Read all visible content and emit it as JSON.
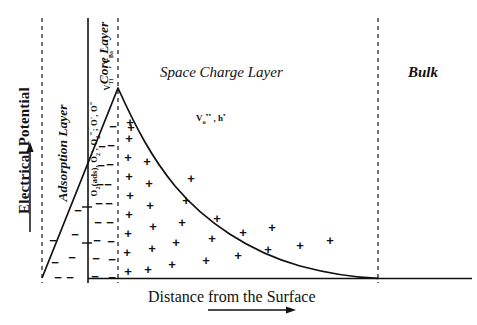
{
  "figure": {
    "type": "schematic-potential-profile",
    "y_axis_label": "Electrical Potential",
    "x_axis_label": "Distance from the Surface",
    "x_axis_arrow": "right-arrow",
    "y_axis_arrow": "up-arrow"
  },
  "regions": [
    {
      "id": "adsorption",
      "label": "Adsorption Layer",
      "species_plain": "O2(ads), O2-, O2=; O-, O=",
      "x_start": 42,
      "x_end": 88
    },
    {
      "id": "core",
      "label": "Core Layer",
      "species_plain": "V_Ti''' , V_Ba''",
      "x_start": 88,
      "x_end": 118
    },
    {
      "id": "space-charge",
      "label": "Space Charge Layer",
      "species_plain": "Vo.. , h.",
      "x_start": 118,
      "x_end": 378
    },
    {
      "id": "bulk",
      "label": "Bulk",
      "species_plain": "",
      "x_start": 378,
      "x_end": 477
    }
  ],
  "chart_data": {
    "type": "line",
    "title": "",
    "xlabel": "Distance from the Surface",
    "ylabel": "Electrical Potential",
    "grid": false,
    "legend": "none",
    "xlim": [
      0,
      477
    ],
    "ylim": [
      0,
      1
    ],
    "annotations": [
      "Adsorption Layer",
      "Core Layer",
      "Space Charge Layer",
      "Bulk"
    ],
    "boundaries_px": [
      42,
      88,
      118,
      378
    ],
    "series": [
      {
        "name": "potential",
        "description": "linear rise through adsorption and core layer to peak, then exponential-like decay to zero at the bulk boundary",
        "points_px": [
          [
            42,
            278
          ],
          [
            60,
            215
          ],
          [
            80,
            160
          ],
          [
            100,
            120
          ],
          [
            118,
            88
          ],
          [
            132,
            112
          ],
          [
            148,
            140
          ],
          [
            168,
            168
          ],
          [
            190,
            192
          ],
          [
            215,
            213
          ],
          [
            245,
            232
          ],
          [
            280,
            250
          ],
          [
            315,
            263
          ],
          [
            345,
            272
          ],
          [
            365,
            276
          ],
          [
            378,
            278
          ]
        ]
      }
    ]
  },
  "charges": {
    "negative_symbol": "−",
    "positive_symbol": "+",
    "negative_positions_px": [
      [
        53,
        240
      ],
      [
        55,
        262
      ],
      [
        58,
        277
      ],
      [
        70,
        277
      ],
      [
        72,
        257
      ],
      [
        75,
        234
      ],
      [
        78,
        210
      ],
      [
        95,
        276
      ],
      [
        96,
        258
      ],
      [
        97,
        240
      ],
      [
        98,
        222
      ],
      [
        99,
        203
      ],
      [
        100,
        184
      ],
      [
        101,
        165
      ],
      [
        102,
        146
      ],
      [
        112,
        277
      ],
      [
        112,
        259
      ],
      [
        111,
        241
      ],
      [
        110,
        222
      ],
      [
        109,
        203
      ],
      [
        108,
        184
      ],
      [
        110,
        164
      ],
      [
        111,
        145
      ],
      [
        113,
        126
      ]
    ],
    "positive_positions_px": [
      [
        128,
        271
      ],
      [
        127,
        252
      ],
      [
        128,
        233
      ],
      [
        129,
        214
      ],
      [
        130,
        195
      ],
      [
        129,
        176
      ],
      [
        128,
        157
      ],
      [
        129,
        138
      ],
      [
        130,
        122
      ],
      [
        131,
        127
      ],
      [
        148,
        269
      ],
      [
        152,
        248
      ],
      [
        153,
        226
      ],
      [
        150,
        205
      ],
      [
        149,
        183
      ],
      [
        147,
        161
      ],
      [
        172,
        264
      ],
      [
        176,
        242
      ],
      [
        182,
        222
      ],
      [
        186,
        200
      ],
      [
        191,
        178
      ],
      [
        206,
        260
      ],
      [
        212,
        238
      ],
      [
        217,
        218
      ],
      [
        238,
        255
      ],
      [
        243,
        232
      ],
      [
        268,
        249
      ],
      [
        272,
        227
      ],
      [
        300,
        245
      ],
      [
        330,
        240
      ]
    ]
  }
}
